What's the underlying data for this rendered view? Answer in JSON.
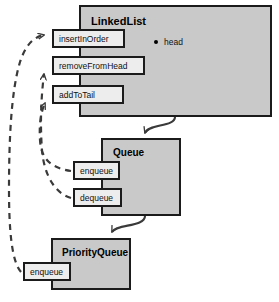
{
  "diagram": {
    "type": "uml-class-inheritance",
    "title_visible": false,
    "classes": [
      {
        "id": "linkedlist",
        "name": "LinkedList",
        "x": 79,
        "y": 5,
        "w": 193,
        "h": 112,
        "title_x": 10,
        "title_y": 8,
        "title_size": 11,
        "fields": [
          {
            "name": "head",
            "x": 75,
            "y": 32,
            "bullet": "filled-dot"
          }
        ],
        "methods": [
          {
            "name": "insertInOrder",
            "x": 52,
            "y": 29,
            "w": 73,
            "h": 19,
            "font": 8.5
          },
          {
            "name": "removeFromHead",
            "x": 52,
            "y": 56,
            "w": 93,
            "h": 19,
            "font": 8.5
          },
          {
            "name": "addToTail",
            "x": 52,
            "y": 85,
            "w": 72,
            "h": 19,
            "font": 8.5
          }
        ]
      },
      {
        "id": "queue",
        "name": "Queue",
        "x": 101,
        "y": 138,
        "w": 80,
        "h": 78,
        "title_x": 10,
        "title_y": 7,
        "title_size": 10,
        "fields": [],
        "methods": [
          {
            "name": "enqueue",
            "x": 73,
            "y": 161,
            "w": 47,
            "h": 19,
            "font": 8.5
          },
          {
            "name": "dequeue",
            "x": 73,
            "y": 188,
            "w": 49,
            "h": 19,
            "font": 8.5
          }
        ]
      },
      {
        "id": "priorityqueue",
        "name": "PriorityQueue",
        "x": 51,
        "y": 238,
        "w": 80,
        "h": 52,
        "title_x": 9,
        "title_y": 7,
        "title_size": 10,
        "fields": [],
        "methods": [
          {
            "name": "enqueue",
            "x": 23,
            "y": 262,
            "w": 48,
            "h": 19,
            "font": 8.5
          }
        ]
      }
    ],
    "connectors": {
      "inheritance": [
        {
          "from": "LinkedList",
          "to": "Queue",
          "style": "solid",
          "arrow": "open"
        },
        {
          "from": "Queue",
          "to": "PriorityQueue",
          "style": "solid",
          "arrow": "open"
        }
      ],
      "overrides": [
        {
          "from": "Queue.enqueue",
          "to": "LinkedList.addToTail",
          "style": "dashed",
          "arrow": "open"
        },
        {
          "from": "Queue.dequeue",
          "to": "LinkedList.removeFromHead",
          "style": "dashed",
          "arrow": "open"
        },
        {
          "from": "PriorityQueue.enqueue",
          "to": "LinkedList.insertInOrder",
          "style": "dashed",
          "arrow": "open"
        }
      ]
    },
    "colors": {
      "class_fill": "#c9c9c9",
      "method_fill": "#ededed",
      "stroke": "#1b1b1b",
      "connector": "#3a3a3a",
      "background": "#ffffff",
      "text": "#111111"
    }
  }
}
